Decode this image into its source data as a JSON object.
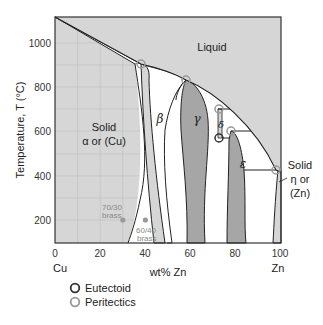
{
  "diagram": {
    "xlabel": "wt% Zn",
    "ylabel": "Temperature, T  (°C)",
    "x_ticks": [
      "0",
      "20",
      "40",
      "60",
      "80",
      "100"
    ],
    "y_ticks": [
      "200",
      "400",
      "600",
      "800",
      "1000"
    ],
    "x_end_left": "Cu",
    "x_end_right": "Zn",
    "xlim": [
      0,
      100
    ],
    "ylim": [
      100,
      1115
    ],
    "regions": {
      "liquid": "Liquid",
      "alpha_line1": "Solid",
      "alpha_line2": "α or (Cu)",
      "beta": "β",
      "gamma": "γ",
      "delta": "δ",
      "epsilon": "ε",
      "eta_line1": "Solid",
      "eta_line2": "η or",
      "eta_line3": "(Zn)"
    },
    "alloys": [
      {
        "label_line1": "70/30",
        "label_line2": "brass",
        "wt_zn": 30,
        "T": 200
      },
      {
        "label_line1": "60/40",
        "label_line2": "brass",
        "wt_zn": 40,
        "T": 200
      }
    ],
    "invariant_points": [
      {
        "type": "peritectic",
        "wt_zn": 38,
        "T": 903
      },
      {
        "type": "peritectic",
        "wt_zn": 58,
        "T": 835
      },
      {
        "type": "peritectic",
        "wt_zn": 73,
        "T": 700
      },
      {
        "type": "peritectic",
        "wt_zn": 78,
        "T": 595
      },
      {
        "type": "peritectic",
        "wt_zn": 98,
        "T": 424
      },
      {
        "type": "eutectoid",
        "wt_zn": 73,
        "T": 558
      }
    ],
    "colors": {
      "single_phase_light": "#d6d6d6",
      "two_phase": "#ffffff",
      "intermetallic_dark": "#a6a6a6",
      "eutectoid": "#333333",
      "peritectic": "#999999"
    }
  },
  "legend": {
    "eutectoid_label": "Eutectoid",
    "peritectic_label": "Peritectics"
  }
}
